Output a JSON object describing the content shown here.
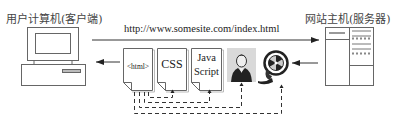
{
  "client": {
    "title": "用户计算机(客户端)"
  },
  "server": {
    "title": "网站主机(服务器)"
  },
  "request": {
    "url": "http://www.somesite.com/index.html"
  },
  "resources": [
    {
      "id": "html",
      "label": "<html>",
      "type": "document"
    },
    {
      "id": "css",
      "label": "CSS",
      "type": "document"
    },
    {
      "id": "js",
      "label_line1": "Java",
      "label_line2": "Script",
      "type": "document"
    },
    {
      "id": "image",
      "label": "portrait-image",
      "type": "image"
    },
    {
      "id": "media",
      "label": "film-reel",
      "type": "media"
    }
  ],
  "colors": {
    "line": "#333333",
    "stroke": "#555555",
    "photo_bg": "#d9d9d9"
  }
}
